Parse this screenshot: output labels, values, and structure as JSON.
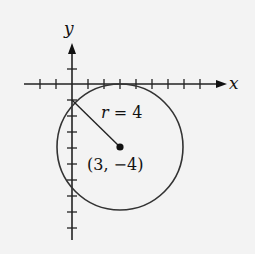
{
  "diagram": {
    "type": "coordinate-plane-circle",
    "axes": {
      "x_label": "x",
      "y_label": "y",
      "origin_px": [
        72,
        84
      ],
      "unit_px": 16,
      "x_ticks": [
        -2,
        -1,
        1,
        2,
        3,
        4,
        5,
        6,
        7,
        8
      ],
      "y_ticks": [
        1,
        -1,
        -2,
        -3,
        -4,
        -5,
        -6,
        -7,
        -8,
        -9
      ]
    },
    "circle": {
      "center": [
        3,
        -4
      ],
      "radius": 4,
      "radius_label": "r = 4",
      "radius_label_var": "r",
      "radius_label_rest": " = 4",
      "center_label": "(3, −4)"
    },
    "colors": {
      "stroke": "#222222",
      "background": "#f3f3f3"
    }
  }
}
